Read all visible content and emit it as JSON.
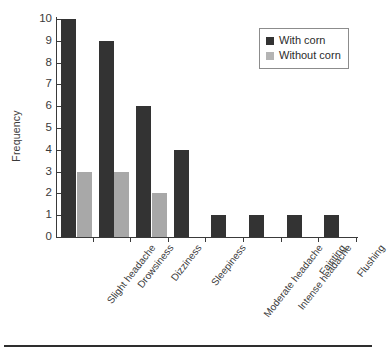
{
  "chart_data": {
    "type": "bar",
    "title": "",
    "xlabel": "",
    "ylabel": "Frequency",
    "ylim": [
      0,
      10
    ],
    "ytick_step": 1,
    "yticks": [
      "0",
      "1",
      "2",
      "3",
      "4",
      "5",
      "6",
      "7",
      "8",
      "9",
      "10"
    ],
    "grid": false,
    "legend_position": "top-right",
    "categories": [
      "Slight headache",
      "Drowsiness",
      "Dizziness",
      "Sleepiness",
      "Moderate headache",
      "Intense headache",
      "Fainting",
      "Flushing"
    ],
    "series": [
      {
        "name": "With corn",
        "color": "#333333",
        "values": [
          10,
          9,
          6,
          4,
          1,
          1,
          1,
          1
        ]
      },
      {
        "name": "Without corn",
        "color": "#a8a8a8",
        "values": [
          3,
          3,
          2,
          0,
          0,
          0,
          0,
          0
        ]
      }
    ]
  },
  "legend": {
    "items": [
      {
        "label": "With corn"
      },
      {
        "label": "Without corn"
      }
    ]
  },
  "axes": {
    "y_title": "Frequency"
  }
}
